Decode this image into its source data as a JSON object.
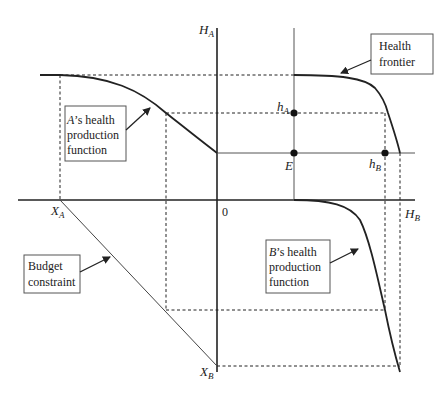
{
  "figure": {
    "type": "four-quadrant health frontier diagram",
    "axes": {
      "vertical_top_label": "H",
      "vertical_top_sub": "A",
      "horizontal_right_label": "H",
      "horizontal_right_sub": "B",
      "horizontal_left_label": "X",
      "horizontal_left_sub": "A",
      "vertical_bottom_label": "X",
      "vertical_bottom_sub": "B",
      "origin_label": "0"
    },
    "points": {
      "hA_label": "h",
      "hA_sub": "A",
      "hB_label": "h",
      "hB_sub": "B",
      "E_label": "E"
    },
    "callouts": {
      "health_frontier": [
        "Health",
        "frontier"
      ],
      "a_production": [
        "A’s health",
        "production",
        "function"
      ],
      "b_production": [
        "B’s health",
        "production",
        "function"
      ],
      "budget": [
        "Budget",
        "constraint"
      ]
    },
    "colors": {
      "ink": "#222222",
      "box_border": "#555555",
      "background": "#ffffff"
    }
  }
}
